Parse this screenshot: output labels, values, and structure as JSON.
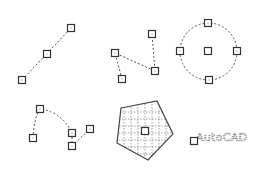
{
  "diagram": {
    "title": "",
    "objects": [
      {
        "type": "line",
        "name": "line",
        "grips": [
          [
            22,
            80
          ],
          [
            47,
            54
          ],
          [
            71,
            28
          ]
        ]
      },
      {
        "type": "polyline",
        "name": "polyline",
        "points": [
          [
            122,
            79
          ],
          [
            115,
            53
          ],
          [
            155,
            71
          ],
          [
            152,
            34
          ]
        ]
      },
      {
        "type": "circle",
        "name": "circle",
        "center": [
          208,
          51
        ],
        "radius": 28,
        "grips": [
          [
            208,
            51
          ],
          [
            208,
            23
          ],
          [
            180,
            51
          ],
          [
            237,
            51
          ],
          [
            209,
            80
          ]
        ]
      },
      {
        "type": "spline",
        "name": "arc-spline",
        "grips": [
          [
            33,
            138
          ],
          [
            40,
            109
          ],
          [
            72,
            133
          ],
          [
            72,
            146
          ],
          [
            90,
            129
          ]
        ]
      },
      {
        "type": "hatch",
        "name": "hatched-pentagon",
        "vertices": [
          [
            121,
            108
          ],
          [
            157,
            101
          ],
          [
            173,
            134
          ],
          [
            148,
            160
          ],
          [
            117,
            143
          ]
        ],
        "grip": [
          145,
          131
        ]
      },
      {
        "type": "text",
        "name": "text-object",
        "grip": [
          194,
          141
        ]
      }
    ],
    "text_label": "AutoCAD",
    "colors": {
      "line": "#555555",
      "grip_border": "#333333",
      "background": "#ffffff"
    }
  }
}
